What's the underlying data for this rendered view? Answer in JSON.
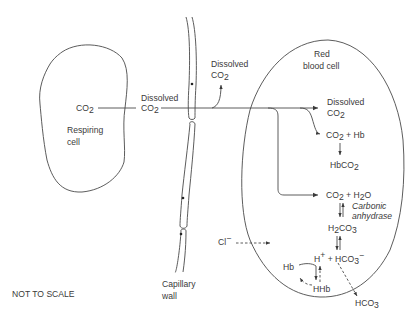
{
  "diagram": {
    "title_note": "NOT TO SCALE",
    "respiring_cell": {
      "label_line1": "Respiring",
      "label_line2": "cell",
      "co2": "CO",
      "co2_sub": "2"
    },
    "interstitial": {
      "dissolved": "Dissolved",
      "co2": "CO",
      "co2_sub": "2"
    },
    "capillary": {
      "label_line1": "Capillary",
      "label_line2": "wall"
    },
    "plasma": {
      "dissolved": "Dissolved",
      "co2": "CO",
      "co2_sub": "2"
    },
    "red_blood_cell": {
      "label_line1": "Red",
      "label_line2": "blood cell",
      "dissolved": "Dissolved",
      "dissolved_co2": "CO",
      "dissolved_co2_sub": "2",
      "co2_hb": "CO",
      "co2_hb_sub": "2",
      "co2_hb_rest": " + Hb",
      "hbco2": "HbCO",
      "hbco2_sub": "2",
      "co2_h2o_a": "CO",
      "co2_h2o_sub1": "2",
      "co2_h2o_b": " + H",
      "co2_h2o_sub2": "2",
      "co2_h2o_c": "O",
      "enzyme_line1": "Carbonic",
      "enzyme_line2": "anhydrase",
      "h2co3_a": "H",
      "h2co3_sub1": "2",
      "h2co3_b": "CO",
      "h2co3_sub2": "3",
      "hplus": "H",
      "hplus_sup": "+",
      "plus": " + ",
      "hco3": "HCO",
      "hco3_sub": "3",
      "hco3_sup": "−",
      "hb": "Hb",
      "hhb": "HHb"
    },
    "chloride": {
      "label": "Cl",
      "sup": "−"
    },
    "outside_hco3": {
      "label": "HCO",
      "sub": "3"
    }
  }
}
